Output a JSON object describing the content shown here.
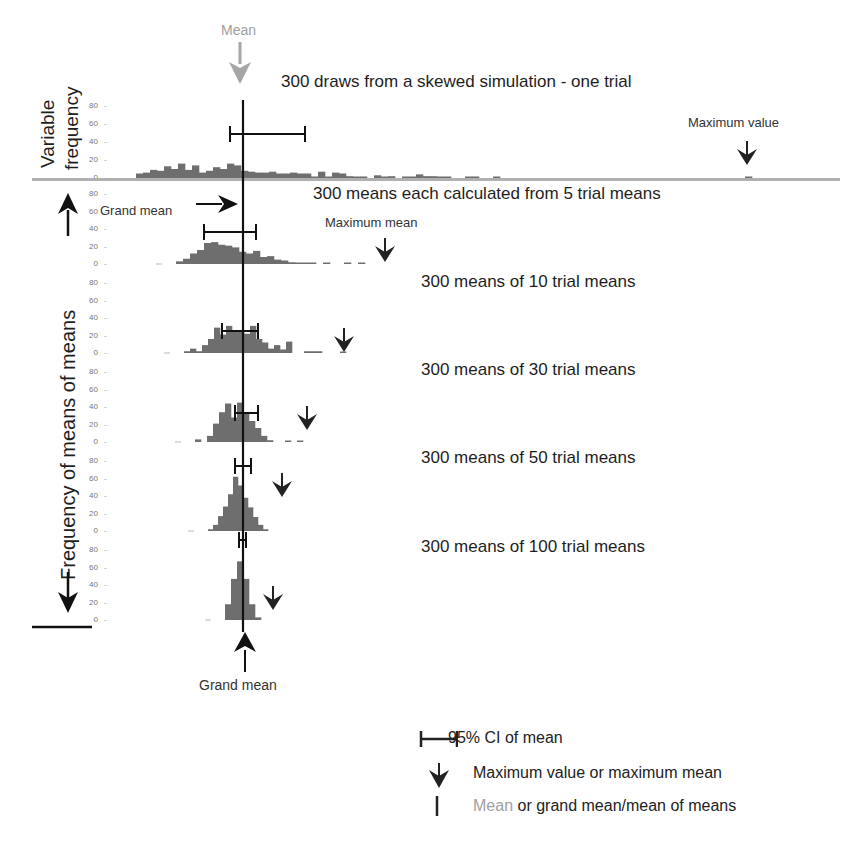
{
  "figure": {
    "top_panel": {
      "title": "300 draws from a skewed simulation - one trial",
      "ylabel_line1": "Variable",
      "ylabel_line2": "frequency",
      "mean_annotation": "Mean",
      "max_annotation": "Maximum value"
    },
    "lower_panels": {
      "ylabel": "Frequency of means of means",
      "grand_mean_top": "Grand mean",
      "grand_mean_bottom": "Grand mean",
      "max_mean_annotation": "Maximum mean",
      "titles": [
        "300 means each calculated from 5 trial means",
        "300 means of 10 trial means",
        "300 means of 30 trial means",
        "300 means of 50 trial means",
        "300 means of 100 trial means"
      ]
    },
    "yticks": [
      "80",
      "60",
      "40",
      "20",
      "0"
    ],
    "legend": {
      "ci": "95% CI of mean",
      "max": "Maximum value or maximum mean",
      "mean_grey": "Mean",
      "mean_rest": " or grand mean/mean of means"
    },
    "colors": {
      "bars": "#6e6e6e",
      "mean_arrow": "#a6a6a6",
      "axis_line": "#b0b0b0",
      "line": "#111111"
    }
  },
  "chart_data": [
    {
      "type": "bar",
      "title": "300 draws from a skewed simulation - one trial",
      "ylabel": "Variable frequency",
      "ylim": [
        0,
        80
      ],
      "yticks": [
        0,
        20,
        40,
        60,
        80
      ],
      "mean_x_px": 243,
      "ci95_px": [
        230,
        305
      ],
      "max_value_px": 747,
      "bin_start_px": 136,
      "bin_width_px": 7,
      "values": [
        5,
        6,
        9,
        8,
        13,
        10,
        16,
        9,
        14,
        6,
        8,
        12,
        10,
        16,
        14,
        8,
        7,
        6,
        6,
        7,
        5,
        5,
        6,
        5,
        5,
        1,
        7,
        1,
        6,
        5,
        2,
        1,
        1,
        0,
        3,
        1,
        2,
        0,
        1,
        1,
        4,
        2,
        2,
        1,
        1,
        0,
        0,
        1,
        1,
        0,
        0,
        1,
        0,
        0,
        0,
        0,
        0,
        0,
        0,
        0,
        0,
        0,
        0,
        0,
        0,
        0,
        0,
        0,
        0,
        0,
        0,
        0,
        0,
        0,
        0,
        0,
        0,
        0,
        0,
        0,
        0,
        0,
        0,
        0,
        0,
        0,
        0,
        1
      ]
    },
    {
      "type": "bar",
      "title": "300 means each calculated from 5 trial means",
      "ylim": [
        0,
        80
      ],
      "grand_mean_px": 243,
      "ci95_px": [
        204,
        256
      ],
      "max_mean_px": 385,
      "bin_start_px": 176,
      "bin_width_px": 7,
      "values": [
        3,
        6,
        12,
        16,
        24,
        25,
        22,
        21,
        19,
        14,
        12,
        15,
        8,
        9,
        5,
        4,
        2,
        1,
        1,
        1,
        0,
        1,
        0,
        0,
        1,
        0,
        1
      ]
    },
    {
      "type": "bar",
      "title": "300 means of 10 trial means",
      "ylim": [
        0,
        80
      ],
      "grand_mean_px": 243,
      "ci95_px": [
        222,
        258
      ],
      "max_mean_px": 344,
      "bin_start_px": 184,
      "bin_width_px": 6,
      "values": [
        2,
        5,
        2,
        9,
        16,
        29,
        21,
        31,
        26,
        26,
        22,
        31,
        16,
        12,
        5,
        9,
        4,
        13,
        0,
        0,
        2,
        2,
        2,
        0,
        0,
        0,
        1
      ]
    },
    {
      "type": "bar",
      "title": "300 means of 30 trial means",
      "ylim": [
        0,
        80
      ],
      "grand_mean_px": 243,
      "ci95_px": [
        235,
        258
      ],
      "max_mean_px": 307,
      "bin_start_px": 195,
      "bin_width_px": 6,
      "values": [
        3,
        0,
        7,
        21,
        34,
        44,
        28,
        45,
        33,
        24,
        16,
        7,
        2,
        0,
        0,
        1,
        0,
        1
      ]
    },
    {
      "type": "bar",
      "title": "300 means of 50 trial means",
      "ylim": [
        0,
        80
      ],
      "grand_mean_px": 243,
      "ci95_px": [
        235,
        251
      ],
      "max_mean_px": 282,
      "bin_start_px": 208,
      "bin_width_px": 5,
      "values": [
        2,
        7,
        17,
        28,
        42,
        62,
        52,
        38,
        27,
        16,
        7,
        2
      ]
    },
    {
      "type": "bar",
      "title": "300 means of 100 trial means",
      "ylim": [
        0,
        80
      ],
      "grand_mean_px": 243,
      "ci95_px": [
        239,
        246
      ],
      "max_mean_px": 273,
      "bin_start_px": 225,
      "bin_width_px": 6,
      "values": [
        18,
        47,
        67,
        47,
        18,
        3
      ]
    }
  ]
}
